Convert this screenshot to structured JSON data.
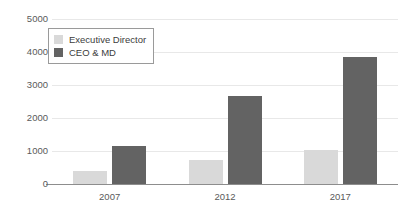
{
  "chart_data": {
    "type": "bar",
    "title": "",
    "subtitle": "",
    "xlabel": "",
    "ylabel": "",
    "categories": [
      "2007",
      "2012",
      "2017"
    ],
    "series": [
      {
        "name": "Executive Director",
        "color": "#d9d9d9",
        "values": [
          380,
          740,
          1030
        ]
      },
      {
        "name": "CEO & MD",
        "color": "#636363",
        "values": [
          1150,
          2660,
          3850
        ]
      }
    ],
    "ylim": [
      0,
      5000
    ],
    "yticks": [
      0,
      1000,
      2000,
      3000,
      4000,
      5000
    ],
    "ytick_labels": [
      "0",
      "1000",
      "2000",
      "3000",
      "4000",
      "5000"
    ],
    "grid": true,
    "grid_axis": "y",
    "legend_position": "upper-left",
    "background_color": "#ffffff",
    "axis_color": "#8d8d8d",
    "grid_color": "#e8e8e8",
    "tick_label_color": "#5a5a5a"
  }
}
